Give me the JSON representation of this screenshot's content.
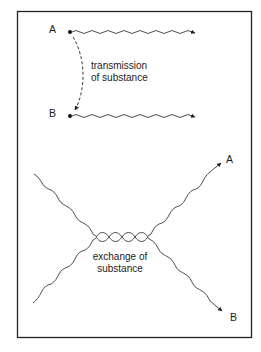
{
  "diagram": {
    "top_section": {
      "label_a": "A",
      "label_b": "B",
      "caption_line1": "transmission",
      "caption_line2": "of substance",
      "arrow_style": "dashed"
    },
    "bottom_section": {
      "label_a": "A",
      "label_b": "B",
      "caption_line1": "exchange of",
      "caption_line2": "substance"
    },
    "colors": {
      "line": "#3a3a3a",
      "frame": "#222222",
      "background": "#ffffff"
    }
  }
}
